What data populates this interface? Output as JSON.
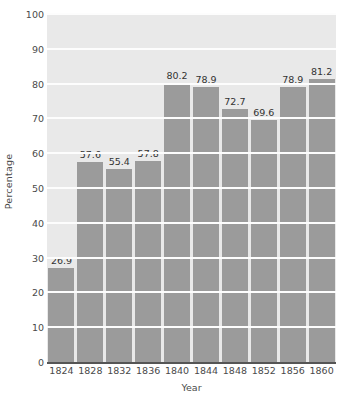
{
  "chart_data": {
    "type": "bar",
    "title": "",
    "subtitle": "",
    "xlabel": "Year",
    "ylabel": "Percentage",
    "categories": [
      "1824",
      "1828",
      "1832",
      "1836",
      "1840",
      "1844",
      "1848",
      "1852",
      "1856",
      "1860"
    ],
    "values": [
      26.9,
      57.6,
      55.4,
      57.8,
      80.2,
      78.9,
      72.7,
      69.6,
      78.9,
      81.2
    ],
    "data_labels": [
      "26.9",
      "57.6",
      "55.4",
      "57.8",
      "80.2",
      "78.9",
      "72.7",
      "69.6",
      "78.9",
      "81.2"
    ],
    "ylim": [
      0,
      100
    ],
    "xlim_categories": 10,
    "y_ticks": [
      0,
      10,
      20,
      30,
      40,
      50,
      60,
      70,
      80,
      90,
      100
    ],
    "y_tick_labels": [
      "0",
      "10",
      "20",
      "30",
      "40",
      "50",
      "60",
      "70",
      "80",
      "90",
      "100"
    ],
    "grid": true,
    "grid_axis": "y",
    "legend": false,
    "legend_position": "none",
    "colors": {
      "bar_fill": "#9b9b9b",
      "plot_background": "#e9e9e9",
      "gridline": "#fdfdfd",
      "axis_line": "#555555",
      "tick_label": "#4a4a4a",
      "data_label": "#333333",
      "figure_background": "#ffffff"
    }
  }
}
